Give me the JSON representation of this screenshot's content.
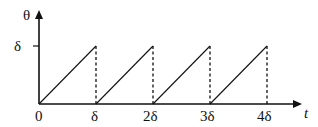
{
  "diagram": {
    "type": "sawtooth waveform",
    "y_axis_label": "θ",
    "x_axis_label": "t",
    "y_tick_label": "δ",
    "x_tick_labels": [
      "0",
      "δ",
      "2δ",
      "3δ",
      "4δ"
    ],
    "segments": [
      {
        "from": [
          0,
          0
        ],
        "to": [
          1,
          1
        ]
      },
      {
        "from": [
          1,
          0
        ],
        "to": [
          2,
          1
        ]
      },
      {
        "from": [
          2,
          0
        ],
        "to": [
          3,
          1
        ]
      },
      {
        "from": [
          3,
          0
        ],
        "to": [
          4,
          1
        ]
      }
    ],
    "dashed_drops_at": [
      1,
      2,
      3,
      4
    ],
    "colors": {
      "line": "#111111",
      "background": "#ffffff"
    }
  }
}
